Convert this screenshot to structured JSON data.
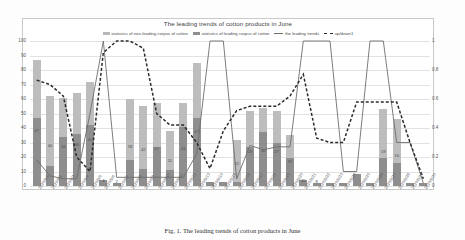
{
  "chart_data": {
    "type": "bar",
    "title": "The leading trends of cotton products in June",
    "xlabel": "",
    "ylabel": "",
    "ylim": [
      0,
      100
    ],
    "y2lim": [
      0,
      1
    ],
    "grid": true,
    "legend_position": "top-center",
    "y_ticks_left": [
      "0",
      "10",
      "20",
      "30",
      "40",
      "50",
      "60",
      "70",
      "80",
      "90",
      "100"
    ],
    "y_ticks_right": [
      "0",
      "0.2",
      "0.4",
      "0.6",
      "0.8",
      "1"
    ],
    "legend": [
      "statistics of non-leading corpus of cotton",
      "statistics of leading corpus of cotton",
      "the leading trends",
      "up/down1"
    ],
    "categories": [
      "2020/6/1",
      "2020/6/2",
      "2020/6/3",
      "2020/6/4",
      "2020/6/5",
      "2020/6/6",
      "2020/6/7",
      "2020/6/8",
      "2020/6/9",
      "2020/6/10",
      "2020/6/11",
      "2020/6/12",
      "2020/6/13",
      "2020/6/14",
      "2020/6/15",
      "2020/6/16",
      "2020/6/17",
      "2020/6/18",
      "2020/6/19",
      "2020/6/20",
      "2020/6/21",
      "2020/6/22",
      "2020/6/23",
      "2020/6/24",
      "2020/6/25",
      "2020/6/26",
      "2020/6/27",
      "2020/6/28",
      "2020/6/29",
      "2020/6/30"
    ],
    "series": [
      {
        "name": "statistics of leading corpus of cotton",
        "stack": "total",
        "color": "#8e8e8e",
        "values": [
          47,
          14,
          34,
          36,
          42,
          4,
          2,
          18,
          12,
          27,
          11,
          41,
          47,
          3,
          3,
          3,
          27,
          37,
          30,
          19,
          4,
          2,
          2,
          2,
          8,
          2,
          19,
          16,
          2,
          2
        ]
      },
      {
        "name": "statistics of non-leading corpus of cotton",
        "stack": "total",
        "color": "#bdbdbd",
        "values": [
          40,
          48,
          27,
          28,
          30,
          0,
          0,
          42,
          43,
          30,
          27,
          16,
          38,
          0,
          0,
          29,
          25,
          17,
          22,
          16,
          0,
          0,
          0,
          0,
          0,
          0,
          34,
          30,
          0,
          0
        ]
      },
      {
        "name": "the leading trends",
        "type": "line",
        "axis": "right",
        "color": "#6e6e6e",
        "values": [
          0.18,
          0.07,
          0.05,
          0.05,
          0.5,
          1.0,
          0.06,
          0.06,
          0.06,
          0.06,
          0.06,
          0.06,
          0.22,
          1.0,
          1.0,
          0.05,
          0.28,
          0.25,
          0.27,
          0.27,
          1.0,
          1.0,
          1.0,
          0.1,
          0.1,
          1.0,
          1.0,
          0.3,
          0.3,
          0.02
        ]
      },
      {
        "name": "up/down1",
        "type": "line-dashed",
        "axis": "right",
        "color": "#2b2b2b",
        "values": [
          0.73,
          0.7,
          0.62,
          0.2,
          0.1,
          0.92,
          1.0,
          1.0,
          0.95,
          0.5,
          0.42,
          0.42,
          0.3,
          0.12,
          0.38,
          0.52,
          0.55,
          0.55,
          0.55,
          0.62,
          0.77,
          0.33,
          0.3,
          0.3,
          0.58,
          0.58,
          0.58,
          0.58,
          0.3,
          0.05
        ]
      }
    ],
    "bar_labels": [
      {
        "index": 0,
        "text": "47"
      },
      {
        "index": 1,
        "text": "40"
      },
      {
        "index": 2,
        "text": "34"
      },
      {
        "index": 3,
        "text": "36"
      },
      {
        "index": 4,
        "text": "42"
      },
      {
        "index": 5,
        "text": "4"
      },
      {
        "index": 6,
        "text": "2"
      },
      {
        "index": 7,
        "text": "18"
      },
      {
        "index": 8,
        "text": "42"
      },
      {
        "index": 9,
        "text": "27"
      },
      {
        "index": 10,
        "text": "11"
      },
      {
        "index": 11,
        "text": "41"
      },
      {
        "index": 12,
        "text": "47"
      },
      {
        "index": 15,
        "text": "32"
      },
      {
        "index": 16,
        "text": "29"
      },
      {
        "index": 17,
        "text": "30"
      },
      {
        "index": 18,
        "text": "27"
      },
      {
        "index": 19,
        "text": "37"
      },
      {
        "index": 20,
        "text": "30"
      },
      {
        "index": 21,
        "text": "8"
      },
      {
        "index": 26,
        "text": "19"
      },
      {
        "index": 27,
        "text": "16"
      }
    ]
  },
  "caption": "Fig. 1. The leading trends of cotton products in June"
}
